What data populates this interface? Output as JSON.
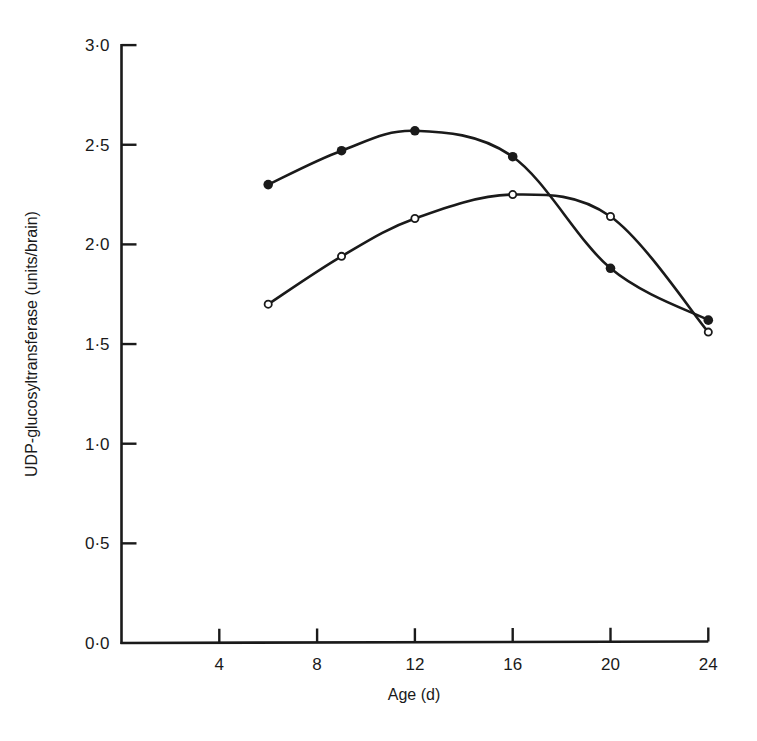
{
  "chart_data": {
    "type": "line",
    "title": "",
    "xlabel": "Age (d)",
    "ylabel": "UDP-glucosyltransferase (units/brain)",
    "xlim": [
      0,
      24
    ],
    "ylim": [
      0,
      3.0
    ],
    "x_ticks": [
      4,
      8,
      12,
      16,
      20,
      24
    ],
    "x_tick_labels": [
      "4",
      "8",
      "12",
      "16",
      "20",
      "24"
    ],
    "y_ticks": [
      0,
      0.5,
      1.0,
      1.5,
      2.0,
      2.5,
      3.0
    ],
    "y_tick_labels": [
      "0·0",
      "0·5",
      "1·0",
      "1·5",
      "2·0",
      "2·5",
      "3·0"
    ],
    "grid": false,
    "legend": null,
    "x": [
      6,
      9,
      12,
      16,
      20,
      24
    ],
    "series": [
      {
        "name": "filled circles",
        "marker": "filled-circle",
        "smooth": true,
        "values": [
          2.3,
          2.47,
          2.57,
          2.44,
          1.88,
          1.62
        ]
      },
      {
        "name": "open circles",
        "marker": "open-circle",
        "smooth": true,
        "values": [
          1.7,
          1.94,
          2.13,
          2.25,
          2.14,
          1.56
        ]
      }
    ]
  },
  "colors": {
    "ink": "#1a1a1a",
    "background": "#ffffff"
  }
}
